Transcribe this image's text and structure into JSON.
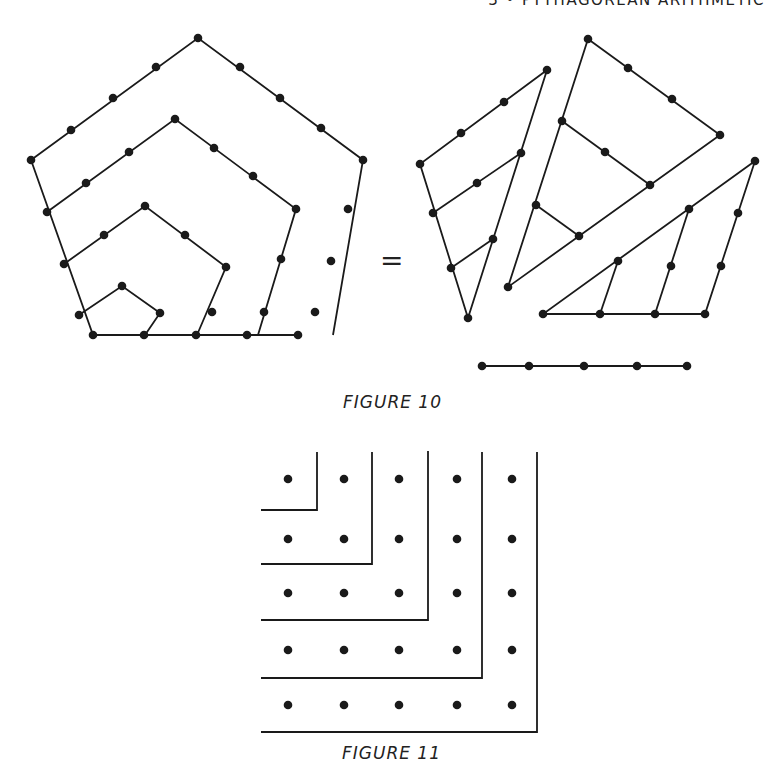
{
  "header": {
    "running_title": "3 • PYTHAGOREAN ARITHMETIC"
  },
  "figure10": {
    "caption": "FIGURE 10",
    "equals_sign": "=",
    "description": "Pentagonal number 5 decomposed: nested pentagon gnomons (left) equal to three triangular numbers plus a row of 5 (right)",
    "left_pentagon_layers": [
      2,
      3,
      4,
      5
    ],
    "right_parts": [
      "triangle-4",
      "triangle-4-plus",
      "triangle-4-bottom",
      "row-5"
    ]
  },
  "figure11": {
    "caption": "FIGURE 11",
    "description": "Square number 25 as sum of odd gnomons",
    "grid_size": 5,
    "gnomons": [
      1,
      3,
      5,
      7,
      9
    ]
  }
}
